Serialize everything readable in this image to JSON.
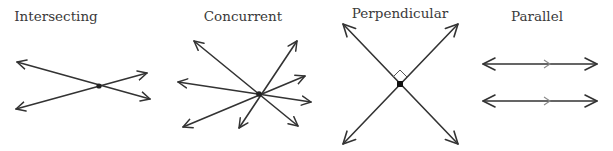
{
  "diagrams": [
    {
      "id": "intersecting",
      "label": "Intersecting",
      "label_x": 56,
      "label_y": 8
    },
    {
      "id": "concurrent",
      "label": "Concurrent",
      "label_x": 243,
      "label_y": 8
    },
    {
      "id": "perpendicular",
      "label": "Perpendicular",
      "label_x": 400,
      "label_y": 5
    },
    {
      "id": "parallel",
      "label": "Parallel",
      "label_x": 537,
      "label_y": 8
    }
  ],
  "colors": {
    "line": "#333333",
    "text": "#3a3a3a",
    "tick": "#8a8a8a"
  }
}
